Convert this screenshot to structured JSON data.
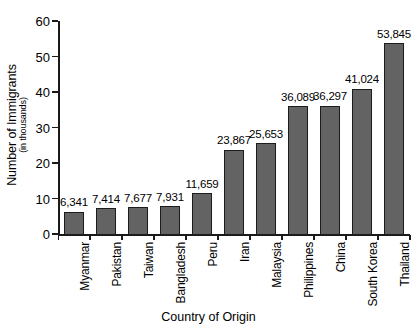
{
  "chart_data": {
    "type": "bar",
    "title": "",
    "xlabel": "Country of Origin",
    "ylabel": "Number of Immigrants",
    "ylabel_sub": "(in thousands)",
    "ylim": [
      0,
      60
    ],
    "yticks": [
      0,
      10,
      20,
      30,
      40,
      50,
      60
    ],
    "ytick_labels": [
      "0",
      "10",
      "20",
      "30",
      "40",
      "50",
      "60"
    ],
    "grid": false,
    "legend": "none",
    "categories": [
      "Myanmar",
      "Pakistan",
      "Taiwan",
      "Bangladesh",
      "Peru",
      "Iran",
      "Malaysia",
      "Philippines",
      "China",
      "South Korea",
      "Thailand"
    ],
    "values": [
      6341,
      7414,
      7677,
      7931,
      11659,
      23867,
      25653,
      36089,
      36297,
      41024,
      53845
    ],
    "value_labels": [
      "6,341",
      "7,414",
      "7,677",
      "7,931",
      "11,659",
      "23,867",
      "25,653",
      "36,089",
      "36,297",
      "41,024",
      "53,845"
    ],
    "value_scale_note": "bar heights plotted in thousands on the y axis",
    "bar_fill_color": "#636363",
    "bar_edge_color": "#1c1c1c",
    "axis_color": "#1a1a1a",
    "background_color": "#ffffff"
  }
}
